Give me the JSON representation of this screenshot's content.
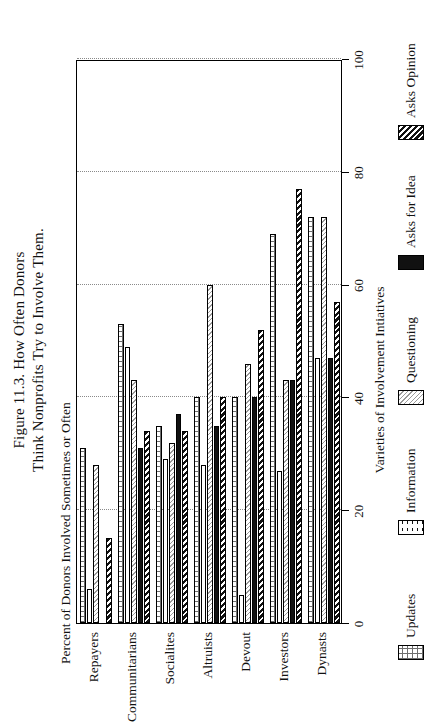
{
  "figure": {
    "title_line1": "Figure 11.3. How Often Donors",
    "title_line2": "Think Nonprofits Try to Involve Them."
  },
  "chart_data": {
    "type": "bar",
    "orientation": "horizontal-grouped",
    "title": "Figure 11.3. How Often Donors Think Nonprofits Try to Involve Them.",
    "xlabel": "Varieties of Involvement Intiatives",
    "ylabel": "Percent of Donors Involved Sometimes or Often",
    "categories": [
      "Repayers",
      "Communitarians",
      "Socialites",
      "Altruists",
      "Devout",
      "Investors",
      "Dynasts"
    ],
    "ylim": [
      0,
      100
    ],
    "yticks": [
      0,
      20,
      40,
      60,
      80,
      100
    ],
    "grid": true,
    "legend_position": "bottom",
    "series": [
      {
        "name": "Updates",
        "pattern": "crosshatch",
        "values": [
          31,
          53,
          35,
          40,
          40,
          69,
          72
        ]
      },
      {
        "name": "Information",
        "pattern": "dots",
        "values": [
          6,
          49,
          29,
          28,
          5,
          27,
          47
        ]
      },
      {
        "name": "Questioning",
        "pattern": "light-diagonal",
        "values": [
          28,
          43,
          32,
          60,
          46,
          43,
          72
        ]
      },
      {
        "name": "Asks for Idea",
        "pattern": "solid-black",
        "values": [
          0,
          31,
          37,
          35,
          40,
          43,
          47
        ]
      },
      {
        "name": "Asks Opinion",
        "pattern": "dark-diagonal",
        "values": [
          15,
          34,
          34,
          40,
          52,
          77,
          57
        ]
      }
    ]
  },
  "axis": {
    "tick_labels": [
      "0",
      "20",
      "40",
      "60",
      "80",
      "100"
    ]
  },
  "legend": {
    "items": [
      {
        "label": "Updates"
      },
      {
        "label": "Information"
      },
      {
        "label": "Questioning"
      },
      {
        "label": "Asks for Idea"
      },
      {
        "label": "Asks Opinion"
      }
    ]
  }
}
